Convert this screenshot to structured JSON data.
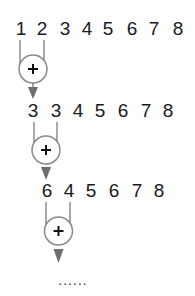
{
  "diagram": {
    "title": "",
    "rows": [
      {
        "values": [
          "1",
          "2",
          "3",
          "4",
          "5",
          "6",
          "7",
          "8"
        ],
        "x": [
          21,
          42,
          65,
          87,
          108,
          132,
          154,
          178
        ],
        "y": 30
      },
      {
        "values": [
          "3",
          "3",
          "4",
          "5",
          "6",
          "7",
          "8"
        ],
        "x": [
          33,
          56,
          78,
          100,
          123,
          146,
          168
        ],
        "y": 112
      },
      {
        "values": [
          "6",
          "4",
          "5",
          "6",
          "7",
          "8"
        ],
        "x": [
          47,
          69,
          91,
          114,
          137,
          159
        ],
        "y": 192
      }
    ],
    "operations": [
      {
        "symbol": "+",
        "inputs": [
          "1",
          "2"
        ],
        "output": "3",
        "cx": 33,
        "cy": 69
      },
      {
        "symbol": "+",
        "inputs": [
          "3",
          "3"
        ],
        "output": "6",
        "cx": 46,
        "cy": 150
      },
      {
        "symbol": "+",
        "inputs": [
          "6",
          "4"
        ],
        "output": "…",
        "cx": 58,
        "cy": 231
      }
    ],
    "continuation": "......",
    "colors": {
      "text": "#1a1a1a",
      "connector": "#7a7a7a",
      "circle": "#8a8a8a",
      "arrow": "#6e6e6e"
    }
  }
}
